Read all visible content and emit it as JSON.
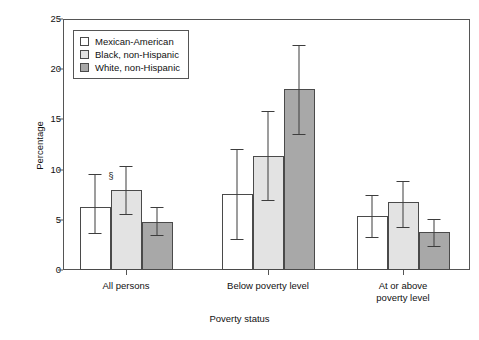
{
  "chart_data": {
    "type": "bar",
    "title": "",
    "xlabel": "Poverty status",
    "ylabel": "Percentage",
    "ylim": [
      0,
      25
    ],
    "yticks": [
      0,
      5,
      10,
      15,
      20,
      25
    ],
    "grid": false,
    "legend_position": "top-left",
    "categories": [
      "All persons",
      "Below poverty level",
      "At or above poverty level"
    ],
    "category_lines": [
      [
        "All persons"
      ],
      [
        "Below poverty level"
      ],
      [
        "At or above",
        "poverty level"
      ]
    ],
    "series": [
      {
        "name": "Mexican-American",
        "color": "#ffffff",
        "values": [
          6.3,
          7.6,
          5.4
        ],
        "ci_low": [
          3.7,
          3.1,
          3.3
        ],
        "ci_high": [
          9.6,
          12.1,
          7.5
        ],
        "annotations": [
          "§",
          "",
          ""
        ]
      },
      {
        "name": "Black, non-Hispanic",
        "color": "#e3e3e3",
        "values": [
          8.0,
          11.4,
          6.8
        ],
        "ci_low": [
          5.6,
          7.0,
          4.3
        ],
        "ci_high": [
          10.4,
          15.8,
          8.9
        ],
        "annotations": [
          "",
          "",
          ""
        ]
      },
      {
        "name": "White, non-Hispanic",
        "color": "#a8a8a8",
        "values": [
          4.8,
          18.0,
          3.8
        ],
        "ci_low": [
          3.5,
          13.5,
          2.4
        ],
        "ci_high": [
          6.3,
          22.4,
          5.1
        ],
        "annotations": [
          "",
          "",
          ""
        ]
      }
    ]
  },
  "legend": {
    "items": [
      {
        "label": "Mexican-American",
        "color": "#ffffff"
      },
      {
        "label": "Black, non-Hispanic",
        "color": "#e3e3e3"
      },
      {
        "label": "White, non-Hispanic",
        "color": "#a8a8a8"
      }
    ]
  }
}
